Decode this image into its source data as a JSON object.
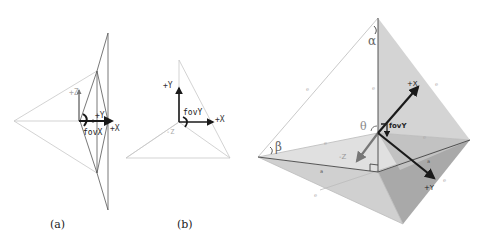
{
  "figure": {
    "panels": [
      {
        "id": "a",
        "caption": "(a)",
        "view": "top view",
        "labels": {
          "z": "+Z",
          "y": "+Y",
          "x": "+X",
          "fov": "fovX"
        }
      },
      {
        "id": "b",
        "caption": "(b)",
        "view": "side view",
        "labels": {
          "y": "+Y",
          "x": "+X",
          "z": "-Z",
          "fov": "fovY"
        }
      },
      {
        "id": "c",
        "caption": "",
        "view": "perspective view",
        "labels": {
          "x": "+X",
          "y": "+Y",
          "z": "-Z",
          "fov": "fovY",
          "alpha": "α",
          "beta": "β",
          "theta": "θ",
          "edge_marks": [
            "e",
            "e",
            "e",
            "e",
            "e",
            "a",
            "a",
            "e",
            "e",
            "e"
          ]
        }
      }
    ],
    "colors": {
      "line_light": "#c8c8c8",
      "line_dark": "#333333",
      "arrow": "#1a1a1a",
      "face_light": "#d9d9d9",
      "face_mid": "#bdbdbd",
      "face_dark": "#9e9e9e",
      "label_gray": "#999999"
    }
  }
}
